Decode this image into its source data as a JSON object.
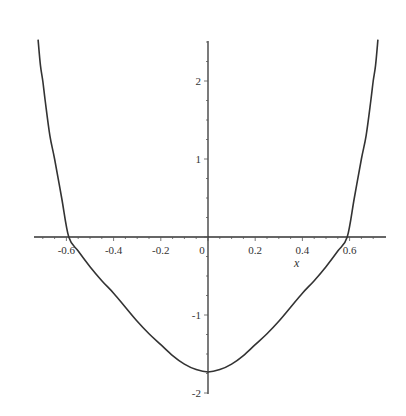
{
  "chart_data": {
    "type": "line",
    "title": "",
    "xlabel": "x",
    "ylabel": "",
    "xlim": [
      -0.74,
      0.75
    ],
    "ylim": [
      -2.0,
      2.5
    ],
    "grid": false,
    "legend": null,
    "x_ticks": [
      -0.6,
      -0.4,
      -0.2,
      0,
      0.2,
      0.4,
      0.6
    ],
    "x_tick_labels": [
      "-0.6",
      "-0.4",
      "-0.2",
      "0",
      "0.2",
      "0.4",
      "0.6"
    ],
    "y_ticks": [
      -2,
      -1,
      1,
      2
    ],
    "y_tick_labels": [
      "-2",
      "-1",
      "1",
      "2"
    ],
    "series": [
      {
        "name": "curve",
        "color": "#333333",
        "x": [
          -0.72,
          -0.71,
          -0.7,
          -0.69,
          -0.67,
          -0.65,
          -0.62,
          -0.59,
          -0.55,
          -0.5,
          -0.45,
          -0.4,
          -0.35,
          -0.3,
          -0.25,
          -0.2,
          -0.15,
          -0.1,
          -0.05,
          0.0,
          0.05,
          0.1,
          0.15,
          0.2,
          0.25,
          0.3,
          0.35,
          0.4,
          0.45,
          0.5,
          0.55,
          0.59,
          0.62,
          0.65,
          0.67,
          0.69,
          0.7,
          0.71,
          0.72
        ],
        "y": [
          2.53,
          2.2,
          2.0,
          1.75,
          1.3,
          1.0,
          0.5,
          0.0,
          -0.18,
          -0.38,
          -0.56,
          -0.72,
          -0.9,
          -1.08,
          -1.24,
          -1.38,
          -1.52,
          -1.63,
          -1.7,
          -1.73,
          -1.7,
          -1.63,
          -1.52,
          -1.38,
          -1.24,
          -1.08,
          -0.9,
          -0.72,
          -0.56,
          -0.38,
          -0.18,
          0.0,
          0.5,
          1.0,
          1.3,
          1.75,
          2.0,
          2.2,
          2.53
        ]
      }
    ],
    "annotations": {
      "minimum": {
        "x": 0,
        "y": -1.73
      },
      "x_intercepts": [
        -0.59,
        0.59
      ]
    }
  }
}
